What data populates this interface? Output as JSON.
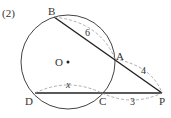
{
  "problem_number": "(2)",
  "points": {
    "B": {
      "label": "B"
    },
    "A": {
      "label": "A"
    },
    "P": {
      "label": "P"
    },
    "C": {
      "label": "C"
    },
    "D": {
      "label": "D"
    },
    "O": {
      "label": "O"
    }
  },
  "measurements": {
    "BA": "6",
    "AP": "4",
    "DC": "x",
    "CP": "3"
  },
  "colors": {
    "line": "#222222",
    "circle": "#444444",
    "dashed": "#999999",
    "text": "#333333"
  }
}
